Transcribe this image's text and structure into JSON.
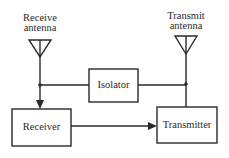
{
  "diagram": {
    "type": "block-diagram",
    "colors": {
      "line": "#2a2a2a",
      "background": "#ffffff"
    },
    "antennas": [
      {
        "id": "receive",
        "label_line1": "Receive",
        "label_line2": "antenna"
      },
      {
        "id": "transmit",
        "label_line1": "Transmit",
        "label_line2": "antenna"
      }
    ],
    "blocks": {
      "isolator": "Isolator",
      "receiver": "Receiver",
      "transmitter": "Transmitter"
    },
    "connections": [
      {
        "from": "receive-antenna",
        "to": "receiver",
        "arrow": true
      },
      {
        "from": "receive-antenna-junction",
        "to": "isolator",
        "arrow": false
      },
      {
        "from": "isolator",
        "to": "transmit-antenna-junction",
        "arrow": false
      },
      {
        "from": "transmitter",
        "to": "transmit-antenna",
        "arrow": false
      },
      {
        "from": "receiver",
        "to": "transmitter",
        "arrow": true
      }
    ]
  }
}
